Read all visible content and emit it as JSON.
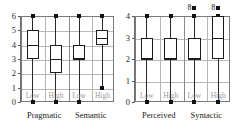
{
  "figure": {
    "title": "",
    "background": "#ffffff",
    "box_color": "#1c1c1c",
    "grid_color": "#b9b9b9",
    "label_color": "#9a9a9a"
  },
  "chart_data": [
    {
      "type": "box",
      "panel_name": "left-panel",
      "title": "",
      "xlabel": "",
      "ylabel": "",
      "ylim": [
        0,
        6
      ],
      "yticks": [
        0,
        1,
        2,
        3,
        4,
        5,
        6
      ],
      "ytick_labels": [
        "0",
        "1",
        "2",
        "3",
        "4",
        "5",
        "6"
      ],
      "grid": true,
      "legend": "none",
      "group_labels": [
        "Pragmatic",
        "Semantic"
      ],
      "category_labels": [
        "Low",
        "High",
        "Low",
        "High"
      ],
      "boxes": [
        {
          "group": "Pragmatic",
          "category": "Low",
          "whisker_low": 0,
          "q1": 3,
          "median": 4,
          "q3": 5,
          "whisker_high": 6,
          "outliers": []
        },
        {
          "group": "Pragmatic",
          "category": "High",
          "whisker_low": 0,
          "q1": 2,
          "median": 3,
          "q3": 4,
          "whisker_high": 6,
          "outliers": []
        },
        {
          "group": "Semantic",
          "category": "Low",
          "whisker_low": 0,
          "q1": 3,
          "median": 3,
          "q3": 4,
          "whisker_high": 6,
          "outliers": []
        },
        {
          "group": "Semantic",
          "category": "High",
          "whisker_low": 1,
          "q1": 4,
          "median": 4.5,
          "q3": 5,
          "whisker_high": 6,
          "outliers": []
        }
      ]
    },
    {
      "type": "box",
      "panel_name": "right-panel",
      "title": "",
      "xlabel": "",
      "ylabel": "",
      "ylim": [
        0,
        4
      ],
      "yticks": [
        0,
        1,
        2,
        3,
        4
      ],
      "ytick_labels": [
        "0",
        "1",
        "2",
        "3",
        "4"
      ],
      "grid": true,
      "legend": "none",
      "group_labels": [
        "Perceived",
        "Syntactic"
      ],
      "category_labels": [
        "Low",
        "High",
        "Low",
        "High"
      ],
      "boxes": [
        {
          "group": "Perceived",
          "category": "Low",
          "whisker_low": 0,
          "q1": 2,
          "median": 2,
          "q3": 3,
          "whisker_high": 4,
          "outliers": []
        },
        {
          "group": "Perceived",
          "category": "High",
          "whisker_low": 0,
          "q1": 2,
          "median": 2,
          "q3": 3,
          "whisker_high": 4,
          "outliers": []
        },
        {
          "group": "Syntactic",
          "category": "Low",
          "whisker_low": 0,
          "q1": 2,
          "median": 2,
          "q3": 3,
          "whisker_high": 4,
          "outliers": [
            {
              "value": 4.35,
              "label": "8"
            }
          ]
        },
        {
          "group": "Syntactic",
          "category": "High",
          "whisker_low": 0,
          "q1": 2,
          "median": 3,
          "q3": 4,
          "whisker_high": 4,
          "outliers": [
            {
              "value": 4.35,
              "label": "8"
            }
          ]
        }
      ]
    }
  ]
}
